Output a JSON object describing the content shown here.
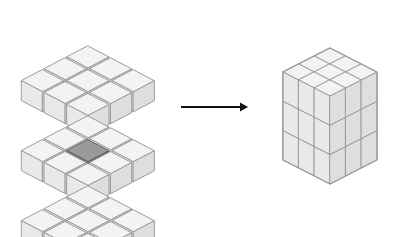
{
  "figure": {
    "title": "",
    "caption": "",
    "background_color": "#ffffff",
    "canvas": {
      "width": 411,
      "height": 237
    }
  },
  "chart_data": {
    "type": "diagram",
    "title": "",
    "panels": [
      {
        "name": "exploded-cube-assembly",
        "label": "",
        "cube_count": 27,
        "grid": [
          3,
          3,
          3
        ],
        "layers": [
          {
            "name": "top-layer",
            "index": 0,
            "cubes": 9
          },
          {
            "name": "middle-layer",
            "index": 1,
            "cubes": 9
          },
          {
            "name": "bottom-layer",
            "index": 2,
            "cubes": 9
          }
        ],
        "highlighted_cube": {
          "name": "center-cube",
          "layer": 1,
          "row": 1,
          "col": 1,
          "color": "#8c8c8c"
        }
      },
      {
        "name": "assembled-cube",
        "label": "",
        "cube_count": 27,
        "grid": [
          3,
          3,
          3
        ],
        "visible_faces": [
          "top",
          "left",
          "right"
        ]
      }
    ],
    "connector": {
      "name": "transform-arrow",
      "label": "",
      "direction": "right",
      "x_start": 181,
      "x_end": 248,
      "y": 107
    }
  },
  "colors": {
    "background": "#ffffff",
    "cube_top": "#f3f3f3",
    "cube_left": "#e9e9e9",
    "cube_right": "#dedede",
    "cube_stroke": "#9b9b9b",
    "highlight_top": "#9a9a9a",
    "highlight_left": "#828282",
    "highlight_right": "#6f6f6f",
    "highlight_stroke": "#5d5d5d",
    "arrow": "#111111"
  },
  "geometry": {
    "exploded": {
      "origin_x": 88,
      "origin_y": 46,
      "half_width": 21,
      "half_depth": 11,
      "cube_height": 20,
      "layer_gap": 70,
      "spacing_scale": 1.0
    },
    "assembled": {
      "origin_x": 330,
      "center_top_y": 48,
      "half_width": 47,
      "half_depth": 24,
      "side_height": 88
    }
  },
  "labels": {
    "left_panel": "",
    "right_panel": "",
    "arrow": ""
  }
}
